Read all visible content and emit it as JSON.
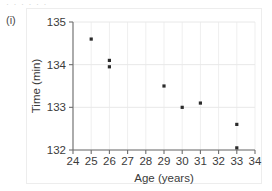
{
  "figure": {
    "item_label": "(i)",
    "top_sliver_text": "· · · · · ·"
  },
  "chart_data": {
    "type": "scatter",
    "title": "",
    "xlabel": "Age (years)",
    "ylabel": "Time (min)",
    "xlim": [
      24,
      34
    ],
    "ylim": [
      132,
      135
    ],
    "xticks": [
      24,
      25,
      26,
      27,
      28,
      29,
      30,
      31,
      32,
      33,
      34
    ],
    "xtick_labels": [
      "24",
      "25",
      "26",
      "27",
      "28",
      "29",
      "30",
      "31",
      "32",
      "33",
      "34"
    ],
    "yticks": [
      132,
      133,
      134,
      135
    ],
    "ytick_labels": [
      "132",
      "133",
      "134",
      "135"
    ],
    "grid": true,
    "legend": null,
    "marker": "square",
    "marker_color": "#2b2b2b",
    "points": [
      {
        "x": 25,
        "y": 134.6
      },
      {
        "x": 26,
        "y": 134.1
      },
      {
        "x": 26,
        "y": 133.95
      },
      {
        "x": 29,
        "y": 133.5
      },
      {
        "x": 30,
        "y": 133.0
      },
      {
        "x": 31,
        "y": 133.1
      },
      {
        "x": 33,
        "y": 132.6
      },
      {
        "x": 33,
        "y": 132.05
      }
    ]
  }
}
